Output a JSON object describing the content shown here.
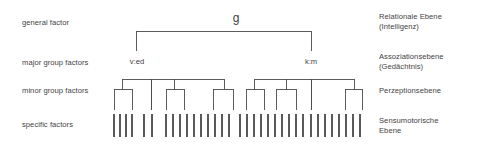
{
  "figure": {
    "title_visible": false,
    "background_color": "#ffffff",
    "line_color": "#4a4a4a"
  },
  "left_labels": [
    {
      "name": "general-factor",
      "text": "general factor",
      "y": 18
    },
    {
      "name": "major-group-factors",
      "text": "major group factors",
      "y": 58
    },
    {
      "name": "minor-group-factors",
      "text": "minor group factors",
      "y": 86
    },
    {
      "name": "specific-factors",
      "text": "specific factors",
      "y": 120
    }
  ],
  "right_labels": [
    {
      "name": "relationale-ebene",
      "text": "Relationale Ebene\n(Intelligenz)",
      "y": 12
    },
    {
      "name": "assoziationsebene",
      "text": "Assoziationsebene\n(Gedächtnis)",
      "y": 52
    },
    {
      "name": "perzeptionsebene",
      "text": "Perzeptionsebene",
      "y": 86
    },
    {
      "name": "sensumotorische-ebene",
      "text": "Sensumotorische\nEbene",
      "y": 116
    }
  ],
  "nodes": [
    {
      "name": "node-g",
      "text": "g",
      "x": 236,
      "y": 12
    },
    {
      "name": "node-ved",
      "text": "v:ed",
      "x": 137,
      "y": 57
    },
    {
      "name": "node-km",
      "text": "k:m",
      "x": 311,
      "y": 57
    }
  ],
  "chart_data": {
    "type": "tree",
    "levels": [
      {
        "label": "general factor",
        "german": "Relationale Ebene (Intelligenz)"
      },
      {
        "label": "major group factors",
        "german": "Assoziationsebene (Gedächtnis)"
      },
      {
        "label": "minor group factors",
        "german": "Perzeptionsebene"
      },
      {
        "label": "specific factors",
        "german": "Sensumotorische Ebene"
      }
    ],
    "root": "g",
    "major_factors": [
      "v:ed",
      "k:m"
    ],
    "minor_group_count": 14,
    "specific_factor_count": 34
  },
  "geometry": {
    "g_bar": {
      "y": 31,
      "x1": 136,
      "x2": 311
    },
    "g_stem_left": {
      "x": 136,
      "y1": 31,
      "y2": 51
    },
    "g_stem_right": {
      "x": 311,
      "y1": 31,
      "y2": 51
    },
    "minor_bar_left": {
      "y": 79,
      "x1": 122,
      "x2": 224
    },
    "minor_bar_right": {
      "y": 79,
      "x1": 254,
      "x2": 354
    },
    "minor_top_y": 79,
    "minor_bottom_y": 110,
    "sub_bar_y": 89,
    "specific_y1": 114,
    "specific_y2": 137,
    "minor_stems_left": [
      122,
      151,
      174,
      224
    ],
    "minor_stems_right": [
      254,
      286,
      311,
      354
    ],
    "sub_brackets": [
      {
        "x1": 114,
        "x2": 132,
        "stem": 122
      },
      {
        "x1": 166,
        "x2": 184,
        "stem": 174
      },
      {
        "x1": 213,
        "x2": 233,
        "stem": 224
      },
      {
        "x1": 246,
        "x2": 264,
        "stem": 254
      },
      {
        "x1": 276,
        "x2": 296,
        "stem": 286
      },
      {
        "x1": 345,
        "x2": 362,
        "stem": 354
      }
    ],
    "minor_leaf_xs": [
      114,
      132,
      151,
      166,
      184,
      213,
      233,
      246,
      264,
      276,
      296,
      311,
      345,
      362
    ],
    "specific_xs": [
      114,
      120,
      126,
      132,
      144,
      152,
      166,
      173,
      180,
      187,
      194,
      201,
      208,
      215,
      222,
      229,
      240,
      247,
      254,
      261,
      268,
      275,
      282,
      289,
      296,
      303,
      311,
      318,
      325,
      332,
      339,
      346,
      353,
      360
    ]
  }
}
